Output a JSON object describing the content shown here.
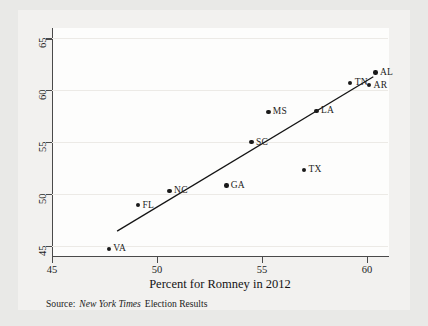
{
  "chart_data": {
    "type": "scatter",
    "title": "",
    "xlabel": "Percent for Romney in 2012",
    "ylabel": "",
    "xlim": [
      45,
      61
    ],
    "ylim": [
      44,
      66
    ],
    "xticks": [
      45,
      50,
      55,
      60
    ],
    "yticks": [
      45,
      50,
      55,
      60,
      65
    ],
    "grid": true,
    "legend": null,
    "points": [
      {
        "label": "VA",
        "x": 47.7,
        "y": 44.7,
        "label_pos": "right"
      },
      {
        "label": "FL",
        "x": 49.1,
        "y": 48.9,
        "label_pos": "right"
      },
      {
        "label": "NC",
        "x": 50.6,
        "y": 50.3,
        "label_pos": "right"
      },
      {
        "label": "GA",
        "x": 53.3,
        "y": 50.8,
        "label_pos": "right"
      },
      {
        "label": "SC",
        "x": 54.5,
        "y": 55.0,
        "label_pos": "right"
      },
      {
        "label": "MS",
        "x": 55.3,
        "y": 57.9,
        "label_pos": "right"
      },
      {
        "label": "TX",
        "x": 57.0,
        "y": 52.3,
        "label_pos": "right"
      },
      {
        "label": "LA",
        "x": 57.6,
        "y": 58.0,
        "label_pos": "right"
      },
      {
        "label": "TN",
        "x": 59.2,
        "y": 60.7,
        "label_pos": "right"
      },
      {
        "label": "AR",
        "x": 60.1,
        "y": 60.5,
        "label_pos": "right"
      },
      {
        "label": "AL",
        "x": 60.4,
        "y": 61.7,
        "label_pos": "right"
      }
    ],
    "fit_line": {
      "x0": 48.1,
      "y0": 46.4,
      "x1": 60.3,
      "y1": 61.3
    }
  },
  "source": {
    "prefix": "Source:",
    "publication": "New York Times",
    "suffix": "Election Results"
  },
  "axis": {
    "x_title": "Percent for Romney in 2012"
  }
}
